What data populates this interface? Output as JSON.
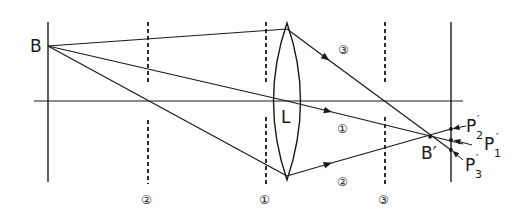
{
  "diagram": {
    "type": "optical-ray-diagram",
    "colors": {
      "ink": "#1a1a1a",
      "background": "#ffffff"
    },
    "object_point": {
      "label": "B",
      "x": 48,
      "y": 46
    },
    "image_point": {
      "label": "B′",
      "x": 430,
      "y": 137
    },
    "lens": {
      "label": "L",
      "x": 287,
      "top": 23,
      "bottom": 180,
      "half_width": 13
    },
    "optical_axis": {
      "y": 101,
      "x_start": 34,
      "x_end": 463
    },
    "object_plane": {
      "x": 48,
      "y_top": 22,
      "y_bottom": 182
    },
    "screen_plane": {
      "x": 451,
      "y_top": 22,
      "y_bottom": 182
    },
    "planes": [
      {
        "id": "2",
        "label": "②",
        "x": 148
      },
      {
        "id": "1",
        "label": "①",
        "x": 266
      },
      {
        "id": "3",
        "label": "③",
        "x": 385
      }
    ],
    "rays": [
      {
        "id": "3",
        "label": "③",
        "label_x": 345,
        "label_y": 48
      },
      {
        "id": "1",
        "label": "①",
        "label_x": 344,
        "label_y": 128
      },
      {
        "id": "2",
        "label": "②",
        "label_x": 344,
        "label_y": 180
      }
    ],
    "screen_points": [
      {
        "label": "P",
        "prime": "′",
        "sub": "2",
        "y": 129
      },
      {
        "label": "P",
        "prime": "′",
        "sub": "1",
        "y": 140
      },
      {
        "label": "P",
        "prime": "′",
        "sub": "3",
        "y": 150
      }
    ]
  }
}
